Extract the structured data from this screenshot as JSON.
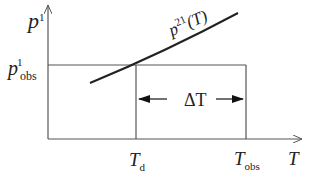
{
  "diagram": {
    "y_axis": {
      "symbol": "p",
      "superscript": "1"
    },
    "x_axis": {
      "symbol": "T"
    },
    "y_level_label": {
      "symbol": "p",
      "superscript": "1",
      "subscript": "obs"
    },
    "curve_label": {
      "symbol": "p",
      "superscript": "21",
      "argument": "(T)"
    },
    "x_marks": [
      {
        "symbol": "T",
        "subscript": "d"
      },
      {
        "symbol": "T",
        "subscript": "obs"
      }
    ],
    "interval_label": "ΔT",
    "colors": {
      "line": "#555555",
      "curve": "#222222",
      "text": "#222222"
    }
  }
}
